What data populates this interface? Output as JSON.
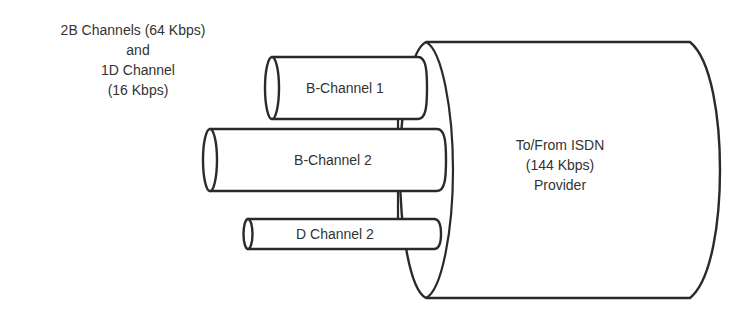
{
  "diagram": {
    "caption": {
      "line1": "2B Channels (64 Kbps)",
      "line2": "and",
      "line3": "1D Channel",
      "line4": "(16 Kbps)"
    },
    "channels": [
      {
        "label": "B-Channel 1"
      },
      {
        "label": "B-Channel 2"
      },
      {
        "label": "D Channel 2"
      }
    ],
    "provider": {
      "line1": "To/From ISDN",
      "line2": "(144 Kbps)",
      "line3": "Provider"
    },
    "colors": {
      "stroke": "#2a2a2a",
      "text": "#333333",
      "fill": "#ffffff"
    }
  }
}
